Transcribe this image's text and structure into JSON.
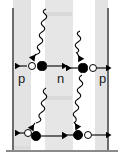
{
  "figure": {
    "type": "pnp-junction-carrier-diagram",
    "title": "",
    "width": 124,
    "height": 161,
    "background_color": "#ffffff"
  },
  "regions": [
    {
      "id": "region-p-left",
      "label": "p",
      "label_x": 18,
      "label_y": 72,
      "x": 13,
      "width": 18,
      "fill": "#e3e3e3"
    },
    {
      "id": "region-depletion-left",
      "label": "",
      "x": 31,
      "width": 14,
      "fill": "#ffffff"
    },
    {
      "id": "region-n-mid",
      "label": "n",
      "label_x": 57,
      "label_y": 72,
      "x": 45,
      "width": 28,
      "fill": "#e6e6e6"
    },
    {
      "id": "region-depletion-right",
      "label": "",
      "x": 73,
      "width": 22,
      "fill": "#ffffff"
    },
    {
      "id": "region-p-right",
      "label": "p",
      "label_x": 99,
      "label_y": 72,
      "x": 95,
      "width": 13,
      "fill": "#e3e3e3"
    }
  ],
  "boundaries": {
    "left_line": {
      "x": 12,
      "y": 8,
      "height": 143,
      "color": "#6b6b6b"
    },
    "right_line": {
      "x": 107,
      "y": 8,
      "height": 143,
      "color": "#6b6b6b"
    },
    "baseline": {
      "x": 6,
      "y": 150,
      "width": 112,
      "color": "#8a8a8a"
    }
  },
  "photons": [
    {
      "id": "photon-top-left",
      "x1": 47,
      "y1": 9,
      "x2": 31,
      "y2": 57,
      "arrow": "down-left",
      "amplitude": 3.4,
      "cycles": 8
    },
    {
      "id": "photon-top-right",
      "x1": 80,
      "y1": 32,
      "x2": 70,
      "y2": 58,
      "arrow": "down-left",
      "amplitude": 3.0,
      "cycles": 5
    },
    {
      "id": "photon-bottom-left",
      "x1": 46,
      "y1": 88,
      "x2": 31,
      "y2": 129,
      "arrow": "down-left",
      "amplitude": 3.2,
      "cycles": 7
    },
    {
      "id": "photon-bottom-right",
      "x1": 81,
      "y1": 75,
      "x2": 73,
      "y2": 128,
      "arrow": "down-left",
      "amplitude": 3.2,
      "cycles": 8
    }
  ],
  "carriers": [
    {
      "id": "carrier-top-left-hole",
      "type": "hole",
      "fill": "open",
      "cx": 32,
      "cy": 66,
      "r": 4.2
    },
    {
      "id": "carrier-top-left-electron",
      "type": "electron",
      "fill": "filled",
      "cx": 42,
      "cy": 66,
      "r": 4.6
    },
    {
      "id": "carrier-top-right-electron",
      "type": "electron",
      "fill": "filled",
      "cx": 83,
      "cy": 68,
      "r": 4.6
    },
    {
      "id": "carrier-top-right-hole",
      "type": "hole",
      "fill": "open",
      "cx": 93,
      "cy": 68,
      "r": 4.2
    },
    {
      "id": "carrier-bot-left-hole",
      "type": "hole",
      "fill": "open",
      "cx": 28,
      "cy": 133,
      "r": 4.2
    },
    {
      "id": "carrier-bot-left-electron",
      "type": "electron",
      "fill": "filled",
      "cx": 36,
      "cy": 136,
      "r": 4.8
    },
    {
      "id": "carrier-bot-right-electron",
      "type": "electron",
      "fill": "filled",
      "cx": 78,
      "cy": 135,
      "r": 5.0
    },
    {
      "id": "carrier-bot-right-hole",
      "type": "hole",
      "fill": "open",
      "cx": 88,
      "cy": 135,
      "r": 4.2
    }
  ],
  "drift_arrows": [
    {
      "id": "arrow-top-left-out",
      "x1": 30,
      "y1": 66,
      "x2": 15,
      "y2": 66,
      "direction": "left"
    },
    {
      "id": "arrow-top-left-in",
      "x1": 46,
      "y1": 66,
      "x2": 62,
      "y2": 66,
      "direction": "right"
    },
    {
      "id": "arrow-top-right-out",
      "x1": 80,
      "y1": 68,
      "x2": 66,
      "y2": 68,
      "direction": "left"
    },
    {
      "id": "arrow-top-right-in",
      "x1": 96,
      "y1": 68,
      "x2": 106,
      "y2": 68,
      "direction": "right"
    },
    {
      "id": "arrow-bot-left-out",
      "x1": 26,
      "y1": 133,
      "x2": 15,
      "y2": 133,
      "direction": "left"
    },
    {
      "id": "arrow-bot-left-in",
      "x1": 41,
      "y1": 136,
      "x2": 62,
      "y2": 136,
      "direction": "right"
    },
    {
      "id": "arrow-bot-right-out",
      "x1": 73,
      "y1": 135,
      "x2": 62,
      "y2": 135,
      "direction": "left"
    },
    {
      "id": "arrow-bot-right-in",
      "x1": 92,
      "y1": 135,
      "x2": 106,
      "y2": 135,
      "direction": "right"
    }
  ],
  "labels": {
    "p_left": "p",
    "n_mid": "n",
    "p_right": "p"
  },
  "colors": {
    "band_fill": "#e4e4e4",
    "line": "#000000",
    "boundary": "#6b6b6b",
    "baseline": "#8a8a8a",
    "text": "#1a1a1a"
  }
}
